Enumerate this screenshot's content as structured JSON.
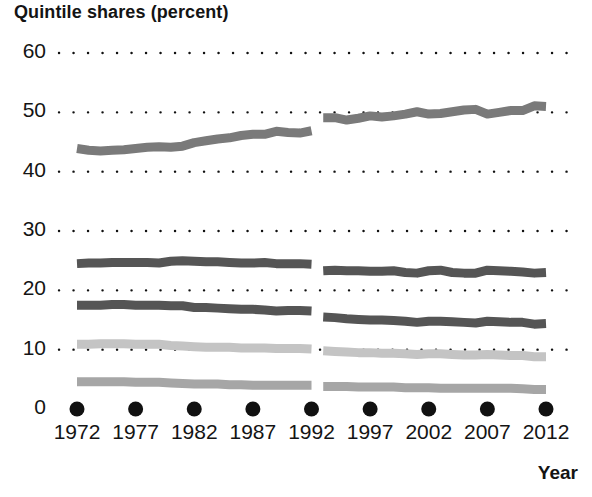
{
  "chart_data": {
    "type": "line",
    "title": "Quintile shares (percent)",
    "xlabel": "Year",
    "ylabel": "",
    "xlim": [
      1972,
      2012
    ],
    "ylim": [
      0,
      60
    ],
    "ytick_labels": [
      "0",
      "10",
      "20",
      "30",
      "40",
      "50",
      "60"
    ],
    "ytick_values": [
      0,
      10,
      20,
      30,
      40,
      50,
      60
    ],
    "xtick_labels": [
      "1972",
      "1977",
      "1982",
      "1987",
      "1992",
      "1997",
      "2002",
      "2007",
      "2012"
    ],
    "xtick_values": [
      1972,
      1977,
      1982,
      1987,
      1992,
      1997,
      2002,
      2007,
      2012
    ],
    "grid": "dotted-horizontal",
    "legend": "none",
    "series_break_year": 1992.5,
    "note_break": "Series discontinuity between 1992 and 1993",
    "x": [
      1972,
      1973,
      1974,
      1975,
      1976,
      1977,
      1978,
      1979,
      1980,
      1981,
      1982,
      1983,
      1984,
      1985,
      1986,
      1987,
      1988,
      1989,
      1990,
      1991,
      1992,
      1993,
      1994,
      1995,
      1996,
      1997,
      1998,
      1999,
      2000,
      2001,
      2002,
      2003,
      2004,
      2005,
      2006,
      2007,
      2008,
      2009,
      2010,
      2011,
      2012
    ],
    "series": [
      {
        "name": "Highest quintile",
        "color": "#7a7a7a",
        "values": [
          43.9,
          43.6,
          43.5,
          43.6,
          43.7,
          43.9,
          44.1,
          44.2,
          44.1,
          44.3,
          44.9,
          45.2,
          45.5,
          45.7,
          46.1,
          46.3,
          46.3,
          46.8,
          46.6,
          46.5,
          46.9,
          49.1,
          49.1,
          48.7,
          49.0,
          49.4,
          49.2,
          49.4,
          49.7,
          50.1,
          49.7,
          49.8,
          50.1,
          50.4,
          50.5,
          49.7,
          50.0,
          50.3,
          50.3,
          51.1,
          51.0
        ]
      },
      {
        "name": "Fourth quintile",
        "color": "#555555",
        "values": [
          24.5,
          24.6,
          24.6,
          24.7,
          24.7,
          24.7,
          24.7,
          24.6,
          24.9,
          25.0,
          24.9,
          24.8,
          24.8,
          24.7,
          24.6,
          24.6,
          24.7,
          24.5,
          24.5,
          24.5,
          24.4,
          23.3,
          23.4,
          23.3,
          23.3,
          23.2,
          23.2,
          23.3,
          23.0,
          22.9,
          23.3,
          23.4,
          23.0,
          22.9,
          22.9,
          23.4,
          23.3,
          23.2,
          23.1,
          22.9,
          23.0
        ]
      },
      {
        "name": "Middle quintile",
        "color": "#555555",
        "values": [
          17.5,
          17.5,
          17.5,
          17.6,
          17.6,
          17.5,
          17.5,
          17.5,
          17.4,
          17.4,
          17.1,
          17.1,
          17.0,
          16.9,
          16.8,
          16.8,
          16.7,
          16.5,
          16.6,
          16.6,
          16.5,
          15.5,
          15.4,
          15.2,
          15.1,
          15.0,
          15.0,
          14.9,
          14.8,
          14.6,
          14.8,
          14.8,
          14.7,
          14.6,
          14.5,
          14.8,
          14.7,
          14.6,
          14.6,
          14.3,
          14.4
        ]
      },
      {
        "name": "Second quintile",
        "color": "#c4c4c4",
        "values": [
          10.9,
          10.9,
          11.0,
          11.0,
          11.0,
          10.9,
          10.9,
          10.9,
          10.7,
          10.6,
          10.5,
          10.4,
          10.4,
          10.4,
          10.3,
          10.3,
          10.3,
          10.2,
          10.2,
          10.2,
          10.1,
          9.8,
          9.7,
          9.6,
          9.5,
          9.5,
          9.4,
          9.4,
          9.3,
          9.2,
          9.3,
          9.3,
          9.2,
          9.1,
          9.1,
          9.2,
          9.1,
          9.0,
          9.0,
          8.8,
          8.8
        ]
      },
      {
        "name": "Lowest quintile",
        "color": "#a6a6a6",
        "values": [
          4.6,
          4.6,
          4.6,
          4.6,
          4.6,
          4.5,
          4.5,
          4.5,
          4.4,
          4.3,
          4.2,
          4.2,
          4.2,
          4.1,
          4.1,
          4.0,
          4.0,
          4.0,
          4.0,
          4.0,
          4.0,
          3.8,
          3.8,
          3.8,
          3.7,
          3.7,
          3.7,
          3.7,
          3.6,
          3.6,
          3.6,
          3.5,
          3.5,
          3.5,
          3.5,
          3.5,
          3.5,
          3.5,
          3.4,
          3.3,
          3.3
        ]
      }
    ],
    "tick_marker_color": "#111111"
  }
}
